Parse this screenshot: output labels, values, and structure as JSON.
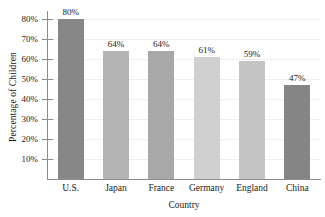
{
  "chart_data": {
    "type": "bar",
    "title": "",
    "xlabel": "Country",
    "ylabel": "Percentage of Children",
    "categories": [
      "U.S.",
      "Japan",
      "France",
      "Germany",
      "England",
      "China"
    ],
    "values": [
      80,
      64,
      64,
      61,
      59,
      47
    ],
    "value_labels": [
      "80%",
      "64%",
      "64%",
      "61%",
      "59%",
      "47%"
    ],
    "ylim": [
      0,
      83.5
    ],
    "yticks": [
      10,
      20,
      30,
      40,
      50,
      60,
      70,
      80
    ],
    "ytick_labels": [
      "10%",
      "20%",
      "30%",
      "40%",
      "50%",
      "60%",
      "70%",
      "80%"
    ],
    "grid": true,
    "legend": "none",
    "bar_colors": [
      "#878787",
      "#b4b4b4",
      "#a8a8a8",
      "#d0d0d0",
      "#c4c4c4",
      "#858585"
    ],
    "axis_color": "#8d8d8d",
    "gridline_color": "#f0f0f0",
    "background": "#ffffff"
  }
}
